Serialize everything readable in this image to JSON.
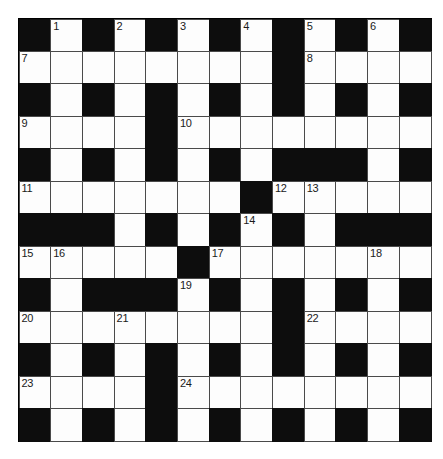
{
  "puzzle": {
    "type": "crossword-grid",
    "rows": 13,
    "columns": 13,
    "colors": {
      "block": "#0d0d0d",
      "cell": "#fdfdfd",
      "gridline": "#4a4a4a",
      "number": "#1a1a1a",
      "background": "#ffffff"
    },
    "legend": {
      "block_token": "#",
      "open_token": "."
    },
    "layout": [
      "#.#.#.#.#.#.#",
      "........#....",
      "#.#.#.#.#.#.#",
      "....#........",
      "#.#.#.#.###.#",
      ".......#.....",
      "###.#.#.#.###",
      ".....#.......",
      "#.###.#.#.#.#",
      "........#....",
      "#.#.#.#.#.#.#",
      "....#........",
      "#.#.#.#.#.#.#"
    ],
    "numbers": [
      {
        "number": "1",
        "row": 1,
        "col": 2
      },
      {
        "number": "2",
        "row": 1,
        "col": 4
      },
      {
        "number": "3",
        "row": 1,
        "col": 6
      },
      {
        "number": "4",
        "row": 1,
        "col": 8
      },
      {
        "number": "5",
        "row": 1,
        "col": 10
      },
      {
        "number": "6",
        "row": 1,
        "col": 12
      },
      {
        "number": "7",
        "row": 2,
        "col": 1
      },
      {
        "number": "8",
        "row": 2,
        "col": 10
      },
      {
        "number": "9",
        "row": 4,
        "col": 1
      },
      {
        "number": "10",
        "row": 4,
        "col": 6
      },
      {
        "number": "11",
        "row": 6,
        "col": 1
      },
      {
        "number": "12",
        "row": 6,
        "col": 9
      },
      {
        "number": "13",
        "row": 6,
        "col": 10
      },
      {
        "number": "14",
        "row": 7,
        "col": 8
      },
      {
        "number": "15",
        "row": 8,
        "col": 1
      },
      {
        "number": "16",
        "row": 8,
        "col": 2
      },
      {
        "number": "17",
        "row": 8,
        "col": 7
      },
      {
        "number": "18",
        "row": 8,
        "col": 12
      },
      {
        "number": "19",
        "row": 9,
        "col": 6
      },
      {
        "number": "20",
        "row": 10,
        "col": 1
      },
      {
        "number": "21",
        "row": 10,
        "col": 4
      },
      {
        "number": "22",
        "row": 10,
        "col": 10
      },
      {
        "number": "23",
        "row": 12,
        "col": 1
      },
      {
        "number": "24",
        "row": 12,
        "col": 6
      }
    ]
  }
}
